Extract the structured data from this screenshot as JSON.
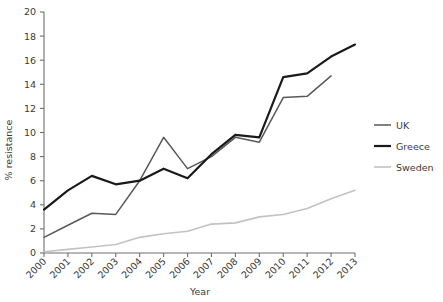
{
  "chart_data": {
    "type": "line",
    "title": "",
    "xlabel": "Year",
    "ylabel": "% resistance",
    "categories": [
      "2000",
      "2001",
      "2002",
      "2003",
      "2004",
      "2005",
      "2006",
      "2007",
      "2008",
      "2009",
      "2010",
      "2011",
      "2012",
      "2013"
    ],
    "x": [
      2000,
      2001,
      2002,
      2003,
      2004,
      2005,
      2006,
      2007,
      2008,
      2009,
      2010,
      2011,
      2012,
      2013
    ],
    "xlim": [
      2000,
      2013
    ],
    "ylim": [
      0,
      20
    ],
    "yticks": [
      0,
      2,
      4,
      6,
      8,
      10,
      12,
      14,
      16,
      18,
      20
    ],
    "ytick_labels": [
      "0",
      "2",
      "4",
      "6",
      "8",
      "10",
      "12",
      "14",
      "16",
      "18",
      "20"
    ],
    "grid": false,
    "legend_position": "right",
    "series": [
      {
        "name": "UK",
        "color": "#595959",
        "width": 1.5,
        "values": [
          1.3,
          2.3,
          3.3,
          3.2,
          6.0,
          9.6,
          7.0,
          8.0,
          9.6,
          9.2,
          12.9,
          13.0,
          14.7,
          null
        ]
      },
      {
        "name": "Greece",
        "color": "#1a1a1a",
        "width": 2.2,
        "values": [
          3.6,
          5.2,
          6.4,
          5.7,
          6.0,
          7.0,
          6.2,
          8.2,
          9.8,
          9.6,
          14.6,
          14.9,
          16.3,
          17.3
        ]
      },
      {
        "name": "Sweden",
        "color": "#c2c2c2",
        "width": 1.6,
        "values": [
          0.1,
          0.3,
          0.5,
          0.7,
          1.3,
          1.6,
          1.8,
          2.4,
          2.5,
          3.0,
          3.2,
          3.7,
          4.5,
          5.2
        ]
      }
    ]
  },
  "legend": {
    "items": [
      {
        "label": "UK"
      },
      {
        "label": "Greece"
      },
      {
        "label": "Sweden"
      }
    ]
  },
  "axes": {
    "x_title": "Year",
    "y_title": "% resistance"
  },
  "colors": {
    "uk": "#595959",
    "greece": "#1a1a1a",
    "sweden": "#c2c2c2",
    "axis": "#6e6e6e",
    "text": "#3a3a3a",
    "background": "#ffffff"
  }
}
